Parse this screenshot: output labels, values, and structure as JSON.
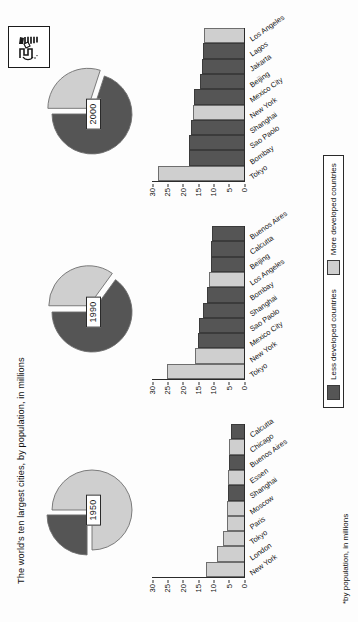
{
  "header": {
    "title": "The world's ten largest cities, by population, in millions",
    "logo_icon": "publisher-logo-icon"
  },
  "legend": {
    "less_label": "Less developed countries",
    "more_label": "More developed countries",
    "less_color": "#555555",
    "more_color": "#cfcfcf"
  },
  "footnote": "*by population, in millions",
  "axis": {
    "ticks": [
      "0",
      "5",
      "10",
      "15",
      "20",
      "25",
      "30"
    ],
    "min": 0,
    "max": 30
  },
  "panels": [
    {
      "year": "1950",
      "pie": {
        "slices": [
          {
            "name": "More developed countries",
            "percent": 75,
            "color": "#cfcfcf",
            "exploded": false
          },
          {
            "name": "Less developed countries",
            "percent": 25,
            "color": "#555555",
            "exploded": true
          }
        ]
      },
      "bars": [
        {
          "city": "New York",
          "value": 12.3,
          "group": "more"
        },
        {
          "city": "London",
          "value": 8.7,
          "group": "more"
        },
        {
          "city": "Tokyo",
          "value": 6.9,
          "group": "more"
        },
        {
          "city": "Paris",
          "value": 5.4,
          "group": "more"
        },
        {
          "city": "Moscow",
          "value": 5.4,
          "group": "more"
        },
        {
          "city": "Shanghai",
          "value": 5.3,
          "group": "less"
        },
        {
          "city": "Essen",
          "value": 5.3,
          "group": "more"
        },
        {
          "city": "Buenos Aires",
          "value": 5.0,
          "group": "less"
        },
        {
          "city": "Chicago",
          "value": 4.9,
          "group": "more"
        },
        {
          "city": "Calcutta",
          "value": 4.4,
          "group": "less"
        }
      ]
    },
    {
      "year": "1990",
      "pie": {
        "slices": [
          {
            "name": "More developed countries",
            "percent": 35,
            "color": "#cfcfcf",
            "exploded": true
          },
          {
            "name": "Less developed countries",
            "percent": 65,
            "color": "#555555",
            "exploded": false
          }
        ]
      },
      "bars": [
        {
          "city": "Tokyo",
          "value": 25.0,
          "group": "more"
        },
        {
          "city": "New York",
          "value": 16.1,
          "group": "more"
        },
        {
          "city": "Mexico City",
          "value": 15.1,
          "group": "less"
        },
        {
          "city": "Sao Paolo",
          "value": 14.8,
          "group": "less"
        },
        {
          "city": "Shanghai",
          "value": 13.5,
          "group": "less"
        },
        {
          "city": "Bombay",
          "value": 12.2,
          "group": "less"
        },
        {
          "city": "Los Angeles",
          "value": 11.5,
          "group": "more"
        },
        {
          "city": "Beijing",
          "value": 10.9,
          "group": "less"
        },
        {
          "city": "Calcutta",
          "value": 10.7,
          "group": "less"
        },
        {
          "city": "Buenos Aires",
          "value": 10.6,
          "group": "less"
        }
      ]
    },
    {
      "year": "2000",
      "pie": {
        "slices": [
          {
            "name": "More developed countries",
            "percent": 30,
            "color": "#cfcfcf",
            "exploded": true
          },
          {
            "name": "Less developed countries",
            "percent": 70,
            "color": "#555555",
            "exploded": false
          }
        ]
      },
      "bars": [
        {
          "city": "Tokyo",
          "value": 27.9,
          "group": "more"
        },
        {
          "city": "Bombay",
          "value": 18.1,
          "group": "less"
        },
        {
          "city": "Sao Paolo",
          "value": 17.8,
          "group": "less"
        },
        {
          "city": "Shanghai",
          "value": 17.2,
          "group": "less"
        },
        {
          "city": "New York",
          "value": 16.6,
          "group": "more"
        },
        {
          "city": "Mexico City",
          "value": 16.4,
          "group": "less"
        },
        {
          "city": "Beijing",
          "value": 14.2,
          "group": "less"
        },
        {
          "city": "Jakarta",
          "value": 13.7,
          "group": "less"
        },
        {
          "city": "Lagos",
          "value": 13.5,
          "group": "less"
        },
        {
          "city": "Los Angeles",
          "value": 13.1,
          "group": "more"
        }
      ]
    }
  ],
  "chart_data": {
    "type": "bar",
    "title": "The world's ten largest cities, by population, in millions",
    "xlabel": "",
    "ylabel": "Population (millions)",
    "ylim": [
      0,
      30
    ],
    "yticks": [
      0,
      5,
      10,
      15,
      20,
      25,
      30
    ],
    "grid": false,
    "legend_position": "bottom",
    "legend": [
      "Less developed countries",
      "More developed countries"
    ],
    "note": "*by population, in millions",
    "panels": [
      {
        "year": "1950",
        "categories": [
          "New York",
          "London",
          "Tokyo",
          "Paris",
          "Moscow",
          "Shanghai",
          "Essen",
          "Buenos Aires",
          "Chicago",
          "Calcutta"
        ],
        "values": [
          12.3,
          8.7,
          6.9,
          5.4,
          5.4,
          5.3,
          5.3,
          5.0,
          4.9,
          4.4
        ],
        "groups": [
          "more",
          "more",
          "more",
          "more",
          "more",
          "less",
          "more",
          "less",
          "more",
          "less"
        ],
        "pie": {
          "type": "pie",
          "labels": [
            "More developed countries",
            "Less developed countries"
          ],
          "values": [
            75,
            25
          ]
        }
      },
      {
        "year": "1990",
        "categories": [
          "Tokyo",
          "New York",
          "Mexico City",
          "Sao Paolo",
          "Shanghai",
          "Bombay",
          "Los Angeles",
          "Beijing",
          "Calcutta",
          "Buenos Aires"
        ],
        "values": [
          25.0,
          16.1,
          15.1,
          14.8,
          13.5,
          12.2,
          11.5,
          10.9,
          10.7,
          10.6
        ],
        "groups": [
          "more",
          "more",
          "less",
          "less",
          "less",
          "less",
          "more",
          "less",
          "less",
          "less"
        ],
        "pie": {
          "type": "pie",
          "labels": [
            "More developed countries",
            "Less developed countries"
          ],
          "values": [
            35,
            65
          ]
        }
      },
      {
        "year": "2000",
        "categories": [
          "Tokyo",
          "Bombay",
          "Sao Paolo",
          "Shanghai",
          "New York",
          "Mexico City",
          "Beijing",
          "Jakarta",
          "Lagos",
          "Los Angeles"
        ],
        "values": [
          27.9,
          18.1,
          17.8,
          17.2,
          16.6,
          16.4,
          14.2,
          13.7,
          13.5,
          13.1
        ],
        "groups": [
          "more",
          "less",
          "less",
          "less",
          "more",
          "less",
          "less",
          "less",
          "less",
          "more"
        ],
        "pie": {
          "type": "pie",
          "labels": [
            "More developed countries",
            "Less developed countries"
          ],
          "values": [
            30,
            70
          ]
        }
      }
    ]
  }
}
